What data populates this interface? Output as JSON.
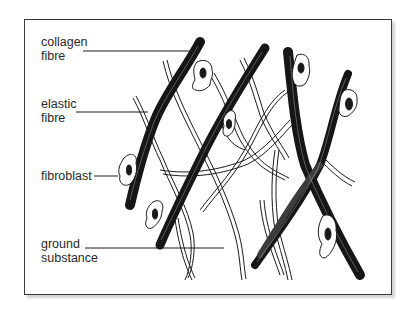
{
  "diagram": {
    "labels": [
      {
        "id": "collagen",
        "line1": "collagen",
        "line2": "fibre"
      },
      {
        "id": "elastic",
        "line1": "elastic",
        "line2": "fibre"
      },
      {
        "id": "fibroblast",
        "line1": "fibroblast",
        "line2": ""
      },
      {
        "id": "ground",
        "line1": "ground",
        "line2": "substance"
      }
    ],
    "elements": {
      "collagen_fibres": 5,
      "fibroblasts": 6,
      "elastic_fibres": "network of thin wavy fibres"
    },
    "colors": {
      "ink": "#1a1a1a",
      "background": "#ffffff",
      "frame": "#3a3a3a"
    }
  }
}
